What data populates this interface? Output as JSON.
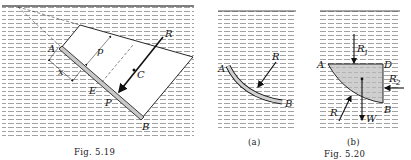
{
  "figures": [
    {
      "id": "fig-5-19",
      "caption": "Fig. 5.19",
      "labels": {
        "A": "A",
        "B": "B",
        "C": "C",
        "E": "E",
        "P": "P",
        "R": "R",
        "p": "p",
        "x": "x"
      }
    },
    {
      "id": "fig-5-20",
      "caption": "Fig. 5.20",
      "panels": [
        {
          "id": "a",
          "caption": "(a)",
          "labels": {
            "A": "A",
            "B": "B",
            "R": "R"
          }
        },
        {
          "id": "b",
          "caption": "(b)",
          "labels": {
            "A": "A",
            "B": "B",
            "D": "D",
            "R": "R",
            "R1": "R",
            "R1_sub": "1",
            "R2": "R",
            "R2_sub": "2",
            "W": "W"
          }
        }
      ]
    }
  ],
  "colors": {
    "line": "#111111",
    "water": "#9a9a9a",
    "fill": "#d8d8d8",
    "plate": "#c8c8c8"
  }
}
